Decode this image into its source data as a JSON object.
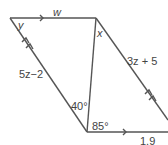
{
  "diagram": {
    "type": "parallelogram-geometry",
    "labels": {
      "y": "y",
      "w": "w",
      "x": "x",
      "left_side": "5z−2",
      "right_side": "3z + 5",
      "angle_40": "40°",
      "angle_85": "85°",
      "bottom": "1.9"
    },
    "colors": {
      "line": "#555555",
      "text": "#444444"
    }
  }
}
